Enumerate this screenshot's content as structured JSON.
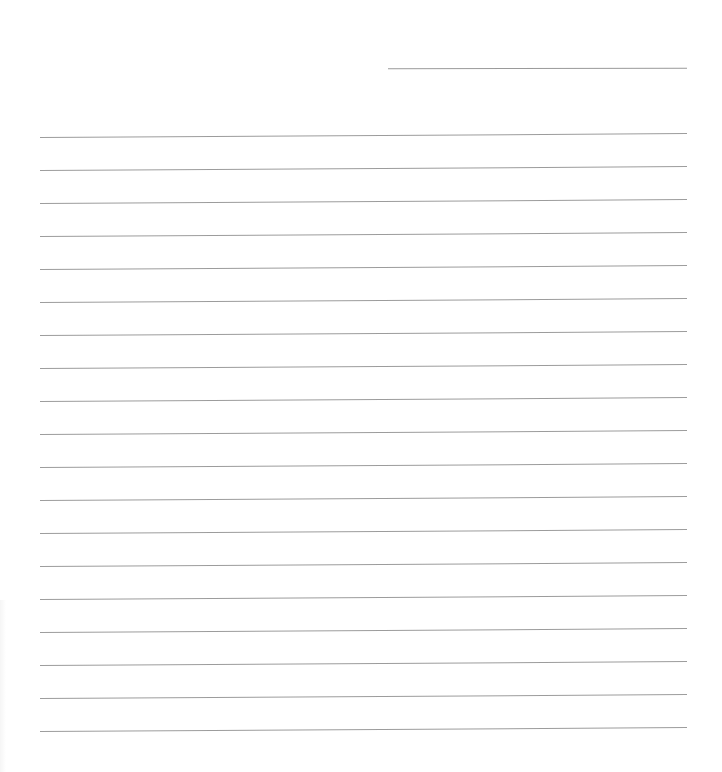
{
  "document": {
    "type": "lined-paper",
    "header_line": {
      "x1": 388,
      "x2": 687,
      "y": 68
    },
    "rules": {
      "count": 19,
      "x_start": 40,
      "x_end": 687,
      "first_y": 137,
      "spacing": 33,
      "color": "#9c9c9c"
    }
  }
}
